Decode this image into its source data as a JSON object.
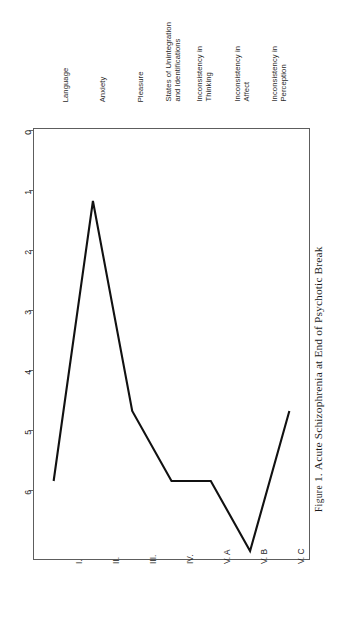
{
  "figure": {
    "caption_prefix": "Figure",
    "caption_number": "1.",
    "caption_text": "Acute Schizophrenia at End of Psychotic Break",
    "orientation": "rotated-90-ccw"
  },
  "axes": {
    "value_axis": {
      "ticks": [
        "0",
        "1",
        "2",
        "3",
        "4",
        "5",
        "6"
      ],
      "min": 0,
      "max": 6
    },
    "category_axis": {
      "ticks": [
        "I.",
        "II.",
        "III.",
        "IV.",
        "V. A",
        "V. B",
        "V. C"
      ]
    }
  },
  "descriptive_labels": [
    {
      "line1": "Language",
      "line2": ""
    },
    {
      "line1": "Anxiety",
      "line2": ""
    },
    {
      "line1": "Pleasure",
      "line2": ""
    },
    {
      "line1": "States of Unintegration",
      "line2": "and Identifications"
    },
    {
      "line1": "Inconsistency in",
      "line2": "Thinking"
    },
    {
      "line1": "Inconsistency in",
      "line2": "Affect"
    },
    {
      "line1": "Inconsistency in",
      "line2": "Perception"
    }
  ],
  "chart_data": {
    "type": "line",
    "xlabel": "",
    "ylabel": "",
    "categories": [
      "I.",
      "II.",
      "III.",
      "IV.",
      "V. A",
      "V. B",
      "V. C"
    ],
    "category_descriptions": [
      "Language",
      "Anxiety",
      "Pleasure",
      "States of Unintegration and Identifications",
      "Inconsistency in Thinking",
      "Inconsistency in Affect",
      "Inconsistency in Perception"
    ],
    "values": [
      5,
      1,
      4,
      5,
      5,
      6,
      4
    ],
    "ylim": [
      0,
      6
    ],
    "y_axis_inverted": true,
    "yticks": [
      0,
      1,
      2,
      3,
      4,
      5,
      6
    ],
    "grid": false,
    "legend": "none",
    "series": [
      {
        "name": "Acute Schizophrenia at End of Psychotic Break",
        "values": [
          5,
          1,
          4,
          5,
          5,
          6,
          4
        ]
      }
    ]
  },
  "colors": {
    "line": "#111111",
    "frame": "#5d5d5d",
    "text": "#1f1f1f",
    "label_text": "#2b2b2b",
    "background": "#ffffff"
  }
}
